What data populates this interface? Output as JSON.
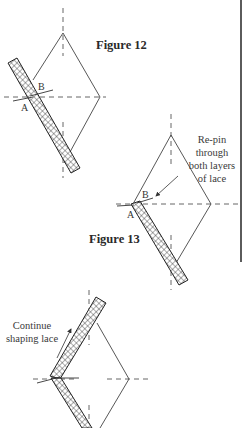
{
  "figures": [
    {
      "id": "figure-12",
      "label": "Figure 12",
      "points": {
        "a": "A",
        "b": "B"
      }
    },
    {
      "id": "figure-13",
      "label": "Figure 13",
      "points": {
        "a": "A",
        "b": "B"
      },
      "annotation": [
        "Re-pin",
        "through",
        "both layers",
        "of lace"
      ]
    },
    {
      "id": "figure-14",
      "annotation": [
        "Continue",
        "shaping lace"
      ]
    }
  ],
  "colors": {
    "line": "#444444",
    "lace_fill": "#ffffff",
    "lace_mesh": "#333333",
    "border": "#333333"
  }
}
